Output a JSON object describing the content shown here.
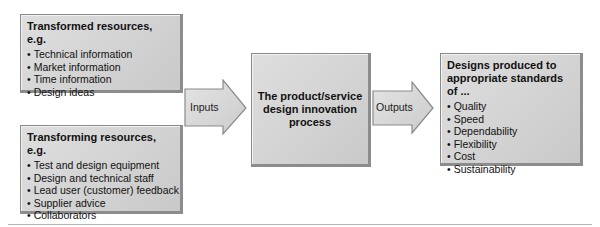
{
  "diagram": {
    "transformed_resources": {
      "title": "Transformed resources, e.g.",
      "items": [
        "Technical information",
        "Market information",
        "Time information",
        "Design ideas"
      ]
    },
    "transforming_resources": {
      "title": "Transforming resources, e.g.",
      "items": [
        "Test and design equipment",
        "Design and technical staff",
        "Lead user (customer) feedback",
        "Supplier advice",
        "Collaborators"
      ]
    },
    "inputs_arrow": {
      "label": "Inputs"
    },
    "process": {
      "title": "The product/service design innovation process"
    },
    "outputs_arrow": {
      "label": "Outputs"
    },
    "outputs": {
      "title": "Designs produced to appropriate standards of ...",
      "items": [
        "Quality",
        "Speed",
        "Dependability",
        "Flexibility",
        "Cost",
        "Sustainability"
      ]
    }
  },
  "colors": {
    "box_fill": "#d4d4d4",
    "box_border": "#8a8a8a",
    "rule": "#b5b5b5"
  }
}
